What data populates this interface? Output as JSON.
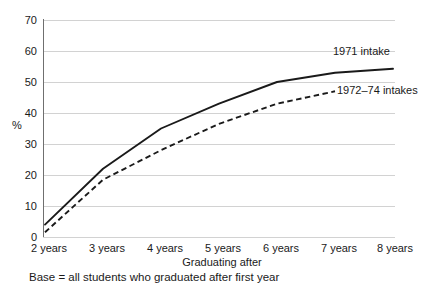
{
  "chart_data": {
    "type": "line",
    "title": "",
    "xlabel": "Graduating after",
    "ylabel": "%",
    "categories": [
      "2 years",
      "3 years",
      "4 years",
      "5 years",
      "6 years",
      "7 years",
      "8 years"
    ],
    "x": [
      2,
      3,
      4,
      5,
      6,
      7,
      8
    ],
    "ylim": [
      0,
      70
    ],
    "yticks": [
      0,
      10,
      20,
      30,
      40,
      50,
      60,
      70
    ],
    "ytick_labels": [
      "0",
      "10",
      "20",
      "30",
      "40",
      "50",
      "60",
      "70"
    ],
    "grid": "horizontal",
    "legend_position": "inline-right-of-line-ends",
    "series": [
      {
        "name": "1971 intake",
        "style": "solid",
        "color": "#1a1a1a",
        "values": [
          4,
          22,
          35,
          43,
          50,
          53,
          54.3
        ]
      },
      {
        "name": "1972–74 intakes",
        "style": "dashed",
        "color": "#1a1a1a",
        "values": [
          1.5,
          18.5,
          28,
          36.5,
          43,
          47,
          null
        ]
      }
    ],
    "annotations": [
      "Base = all students who graduated after first year"
    ]
  },
  "axes": {
    "y_title": "%",
    "x_title": "Graduating after"
  },
  "series_labels": {
    "solid": "1971 intake",
    "dashed": "1972–74 intakes"
  },
  "footnote": {
    "text": "Base = all students who graduated after first year"
  },
  "colors": {
    "line": "#1a1a1a",
    "grid": "#d2d2d2",
    "axis": "#6f6f6f",
    "background": "#ffffff",
    "text": "#1a1a1a"
  }
}
